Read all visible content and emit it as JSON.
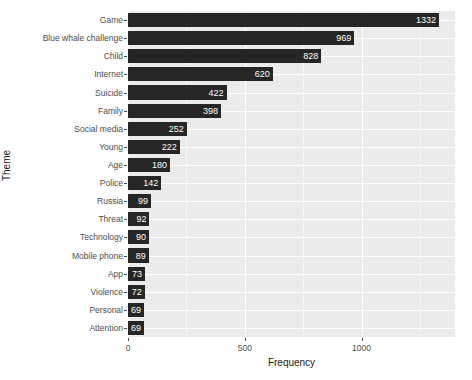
{
  "chart_data": {
    "type": "bar",
    "orientation": "horizontal",
    "title": "",
    "xlabel": "Frequency",
    "ylabel": "Theme",
    "categories": [
      "Game",
      "Blue whale challenge",
      "Child",
      "Internet",
      "Suicide",
      "Family",
      "Social media",
      "Young",
      "Age",
      "Police",
      "Russia",
      "Threat",
      "Technology",
      "Mobile phone",
      "App",
      "Violence",
      "Personal",
      "Attention"
    ],
    "values": [
      1332,
      969,
      828,
      620,
      422,
      398,
      252,
      222,
      180,
      142,
      99,
      92,
      90,
      89,
      73,
      72,
      69,
      69
    ],
    "xlim": [
      0,
      1400
    ],
    "xticks": [
      0,
      500,
      1000
    ],
    "xtick_labels": [
      "0",
      "500",
      "1000"
    ],
    "minor_xticks": [
      250,
      750,
      1250
    ],
    "grid": true,
    "legend": "none",
    "bar_color": "#262626",
    "panel_color": "#ebebeb",
    "gridline_color": "#ffffff",
    "value_label_color": "#ffffff",
    "axis_text_color": "#4d4d4d"
  }
}
